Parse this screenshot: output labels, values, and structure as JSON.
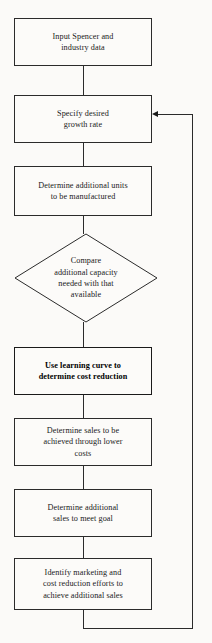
{
  "diagram": {
    "type": "flowchart",
    "orientation": "top-to-bottom with feedback loop",
    "colors": {
      "background": "#fbfaf8",
      "stroke": "#2b2b2b",
      "text": "#1a1a1a",
      "emphasis_stroke": "#1a1a1a"
    },
    "nodes": [
      {
        "id": "input-data",
        "shape": "rectangle",
        "label": "Input Spencer and\nindustry data",
        "emphasis": false
      },
      {
        "id": "specify-growth-rate",
        "shape": "rectangle",
        "label": "Specify desired\ngrowth rate",
        "emphasis": false
      },
      {
        "id": "determine-units",
        "shape": "rectangle",
        "label": "Determine additional units\nto be manufactured",
        "emphasis": false
      },
      {
        "id": "compare-capacity",
        "shape": "diamond",
        "label": "Compare\nadditional capacity\nneeded with that\navailable",
        "emphasis": false
      },
      {
        "id": "learning-curve",
        "shape": "rectangle",
        "label": "Use learning curve to\ndetermine cost reduction",
        "emphasis": true
      },
      {
        "id": "determine-sales-lower-costs",
        "shape": "rectangle",
        "label": "Determine sales to be\nachieved through lower\ncosts",
        "emphasis": false
      },
      {
        "id": "determine-additional-sales",
        "shape": "rectangle",
        "label": "Determine additional\nsales to meet goal",
        "emphasis": false
      },
      {
        "id": "identify-efforts",
        "shape": "rectangle",
        "label": "Identify marketing and\ncost reduction efforts to\nachieve additional sales",
        "emphasis": false
      }
    ],
    "edges": [
      {
        "id": "edge-1",
        "from": "input-data",
        "to": "specify-growth-rate",
        "arrow": false
      },
      {
        "id": "edge-2",
        "from": "specify-growth-rate",
        "to": "determine-units",
        "arrow": false
      },
      {
        "id": "edge-3",
        "from": "determine-units",
        "to": "compare-capacity",
        "arrow": false
      },
      {
        "id": "edge-4",
        "from": "compare-capacity",
        "to": "learning-curve",
        "arrow": false
      },
      {
        "id": "edge-5",
        "from": "learning-curve",
        "to": "determine-sales-lower-costs",
        "arrow": false
      },
      {
        "id": "edge-6",
        "from": "determine-sales-lower-costs",
        "to": "determine-additional-sales",
        "arrow": false
      },
      {
        "id": "edge-7",
        "from": "determine-additional-sales",
        "to": "identify-efforts",
        "arrow": false
      },
      {
        "id": "feedback-loop",
        "from": "identify-efforts",
        "to": "specify-growth-rate",
        "arrow": true,
        "arrow_direction": "left"
      }
    ]
  }
}
